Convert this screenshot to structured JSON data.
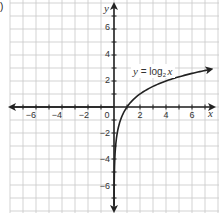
{
  "figure": {
    "part_label": ")",
    "equation": {
      "lhs": "y",
      "equals": " = log",
      "base": "2",
      "arg": "x",
      "full_text": "y = log2 x"
    },
    "axes": {
      "x_label": "x",
      "y_label": "y",
      "x_ticks": [
        "−6",
        "−4",
        "−2",
        "0",
        "2",
        "4",
        "6"
      ],
      "y_ticks": [
        "6",
        "4",
        "2",
        "−2",
        "−4",
        "−6"
      ]
    }
  },
  "chart_data": {
    "type": "line",
    "xlabel": "x",
    "ylabel": "y",
    "xlim": [
      -8,
      8
    ],
    "ylim": [
      -8,
      8
    ],
    "grid": true,
    "x_tick_labels": [
      -6,
      -4,
      -2,
      0,
      2,
      4,
      6
    ],
    "y_tick_labels": [
      -6,
      -4,
      -2,
      2,
      4,
      6
    ],
    "series": [
      {
        "name": "y = log2 x",
        "x": [
          0.0078,
          0.0156,
          0.03125,
          0.0625,
          0.125,
          0.25,
          0.5,
          1,
          2,
          4,
          7.5
        ],
        "y": [
          -7,
          -6,
          -5,
          -4,
          -3,
          -2,
          -1,
          0,
          1,
          2,
          2.91
        ]
      }
    ],
    "annotations": [
      "y = log2 x"
    ]
  }
}
